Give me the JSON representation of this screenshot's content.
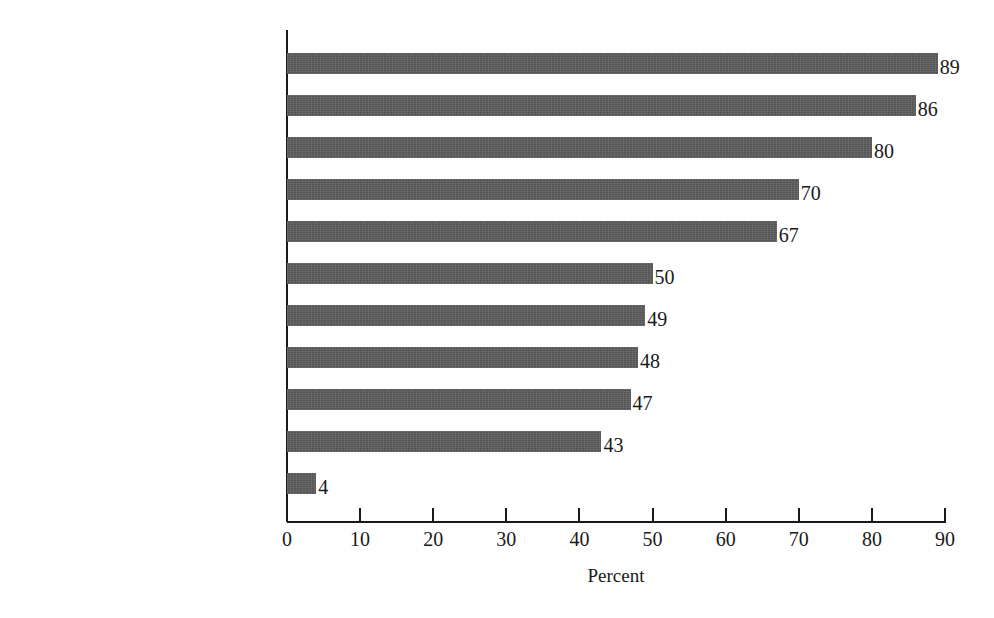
{
  "chart_data": {
    "type": "bar",
    "orientation": "horizontal",
    "title": "",
    "xlabel": "Percent",
    "ylabel": "",
    "xlim": [
      0,
      90
    ],
    "xticks": [
      0,
      10,
      20,
      30,
      40,
      50,
      60,
      70,
      80,
      90
    ],
    "xtick_labels": [
      "0",
      "10",
      "20",
      "30",
      "40",
      "50",
      "60",
      "70",
      "80",
      "90"
    ],
    "grid": false,
    "legend": false,
    "bar_color": "#5d5d5d",
    "axis_color": "#1a1a1a",
    "background_color": "#fefefe",
    "value_labels": true,
    "categories": [
      "Communication skills",
      "Initiative",
      "Ability to motivate others",
      "Ability to organize",
      "Ability to delegate",
      "Good intuition",
      "Ability to apply theories",
      "Ability to capitalize on change",
      "A good team player",
      "Assertiveness",
      "Cunning"
    ],
    "values": [
      89,
      86,
      80,
      70,
      67,
      50,
      49,
      48,
      47,
      43,
      4
    ],
    "value_label_text": [
      "89",
      "86",
      "80",
      "70",
      "67",
      "50",
      "49",
      "48",
      "47",
      "43",
      "4"
    ]
  }
}
